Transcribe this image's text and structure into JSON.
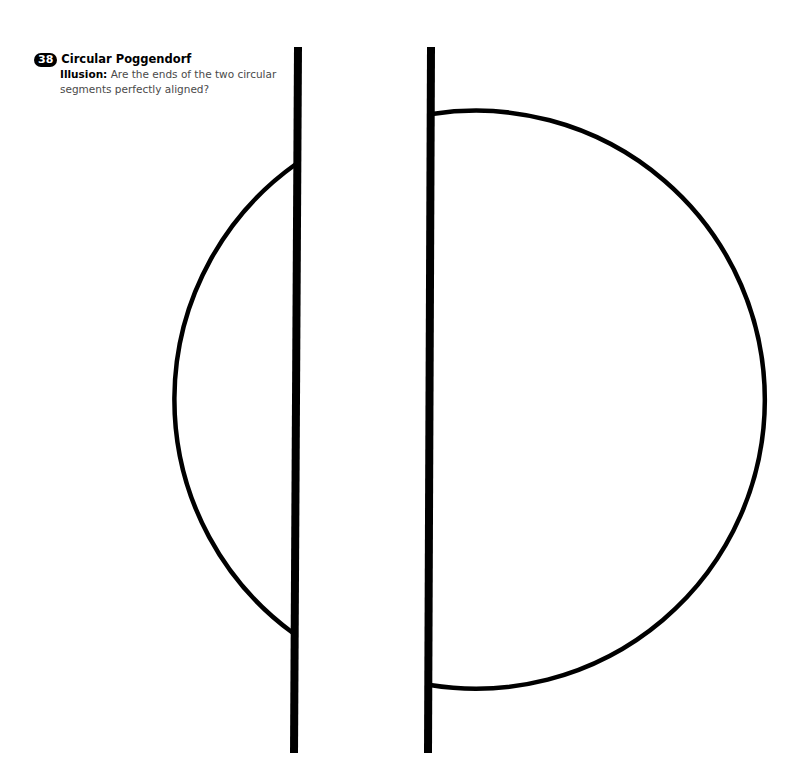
{
  "caption": {
    "number": "38",
    "title": "Circular Poggendorf",
    "lead": "Illusion:",
    "question": "Are the ends of the two circular segments perfectly aligned?"
  },
  "figure": {
    "bar_color": "#000000",
    "arc_color": "#000000",
    "left_bar": {
      "x1": 298,
      "y1": 47,
      "x2": 294,
      "y2": 753,
      "width": 8
    },
    "right_bar": {
      "x1": 431,
      "y1": 47,
      "x2": 428,
      "y2": 753,
      "width": 8
    },
    "left_arc": {
      "top": [
        296,
        164
      ],
      "leftmost": [
        167,
        398
      ],
      "bottom": [
        293,
        633
      ]
    },
    "right_arc": {
      "top": [
        432,
        114
      ],
      "rightmost": [
        761,
        400
      ],
      "bottom": [
        430,
        685
      ]
    }
  }
}
